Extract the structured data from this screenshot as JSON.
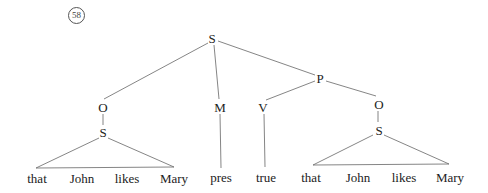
{
  "example_number": "58",
  "nodes": {
    "root_s": "S",
    "left_o": "O",
    "left_s": "S",
    "m": "M",
    "p": "P",
    "v": "V",
    "right_o": "O",
    "right_s": "S"
  },
  "words": {
    "left": [
      "that",
      "John",
      "likes",
      "Mary"
    ],
    "pres": "pres",
    "true": "true",
    "right": [
      "that",
      "John",
      "likes",
      "Mary"
    ]
  }
}
